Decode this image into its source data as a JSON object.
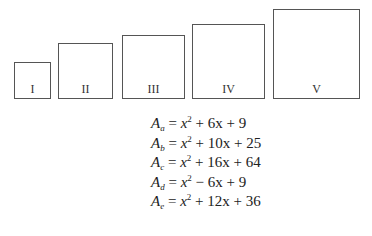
{
  "squares": [
    {
      "label": "I"
    },
    {
      "label": "II"
    },
    {
      "label": "III"
    },
    {
      "label": "IV"
    },
    {
      "label": "V"
    }
  ],
  "equations": [
    {
      "var": "A",
      "sub": "a",
      "lhs_rest": " = ",
      "x": "x",
      "exp": "2",
      "rest": " + 6x + 9"
    },
    {
      "var": "A",
      "sub": "b",
      "lhs_rest": " = ",
      "x": "x",
      "exp": "2",
      "rest": " + 10x + 25"
    },
    {
      "var": "A",
      "sub": "c",
      "lhs_rest": " = ",
      "x": "x",
      "exp": "2",
      "rest": " + 16x + 64"
    },
    {
      "var": "A",
      "sub": "d",
      "lhs_rest": " = ",
      "x": "x",
      "exp": "2",
      "rest": " − 6x + 9"
    },
    {
      "var": "A",
      "sub": "e",
      "lhs_rest": " = ",
      "x": "x",
      "exp": "2",
      "rest": " + 12x + 36"
    }
  ]
}
